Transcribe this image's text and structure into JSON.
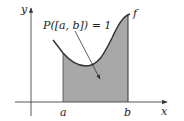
{
  "diagram": {
    "annotation": "P([a, b]) = 1",
    "function_label": "f",
    "x_axis_label": "x",
    "y_axis_label": "y",
    "lower_bound_label": "a",
    "upper_bound_label": "b",
    "colors": {
      "fill": "#a8a8a8",
      "stroke": "#333333",
      "background": "#ffffff"
    }
  }
}
